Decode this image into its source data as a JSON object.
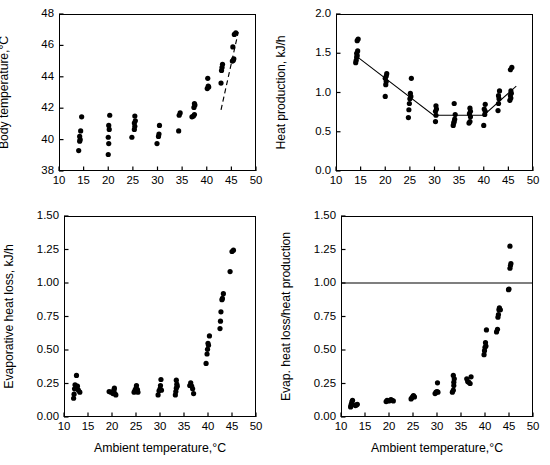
{
  "figure": {
    "shared_xlabel": "Ambient temperature,°C",
    "dot_color": "#000000",
    "line_color": "#000000",
    "background": "#ffffff"
  },
  "chart_data": [
    {
      "id": "body-temperature",
      "type": "scatter",
      "position": "top-left",
      "title": "",
      "xlabel": "",
      "ylabel": "Body temperature,°C",
      "xlim": [
        10,
        50
      ],
      "ylim": [
        38,
        48
      ],
      "xticks": [
        10,
        15,
        20,
        25,
        30,
        35,
        40,
        45,
        50
      ],
      "yticks": [
        38,
        40,
        42,
        44,
        46,
        48
      ],
      "grid": false,
      "legend": null,
      "points": [
        [
          14.0,
          39.3
        ],
        [
          14.2,
          39.9
        ],
        [
          14.3,
          40.0
        ],
        [
          14.2,
          40.2
        ],
        [
          14.4,
          40.55
        ],
        [
          14.6,
          41.45
        ],
        [
          20.0,
          39.05
        ],
        [
          20.1,
          39.75
        ],
        [
          20.0,
          40.15
        ],
        [
          20.2,
          40.65
        ],
        [
          20.1,
          40.9
        ],
        [
          20.3,
          41.55
        ],
        [
          24.8,
          40.15
        ],
        [
          25.3,
          40.65
        ],
        [
          25.4,
          40.85
        ],
        [
          25.3,
          41.05
        ],
        [
          25.5,
          41.2
        ],
        [
          25.4,
          41.5
        ],
        [
          29.9,
          39.75
        ],
        [
          30.2,
          40.2
        ],
        [
          30.3,
          40.35
        ],
        [
          30.4,
          40.9
        ],
        [
          34.3,
          40.55
        ],
        [
          34.4,
          41.55
        ],
        [
          34.6,
          41.7
        ],
        [
          37.0,
          41.45
        ],
        [
          37.3,
          41.5
        ],
        [
          37.5,
          41.6
        ],
        [
          37.4,
          42.05
        ],
        [
          37.6,
          42.2
        ],
        [
          37.5,
          42.3
        ],
        [
          40.1,
          43.25
        ],
        [
          40.3,
          43.4
        ],
        [
          40.4,
          43.35
        ],
        [
          40.2,
          43.9
        ],
        [
          42.9,
          43.6
        ],
        [
          43.0,
          44.4
        ],
        [
          43.1,
          44.6
        ],
        [
          43.2,
          44.8
        ],
        [
          45.2,
          45.0
        ],
        [
          45.4,
          45.05
        ],
        [
          45.5,
          45.15
        ],
        [
          45.3,
          45.9
        ],
        [
          45.6,
          46.7
        ],
        [
          45.9,
          46.8
        ]
      ],
      "annotations": [
        {
          "kind": "dashed-trend-line",
          "x1": 42.9,
          "y1": 41.9,
          "x2": 46.4,
          "y2": 46.85
        }
      ]
    },
    {
      "id": "heat-production",
      "type": "scatter",
      "position": "top-right",
      "title": "",
      "xlabel": "",
      "ylabel": "Heat production, kJ/h",
      "xlim": [
        10,
        50
      ],
      "ylim": [
        0.0,
        2.0
      ],
      "xticks": [
        10,
        15,
        20,
        25,
        30,
        35,
        40,
        45,
        50
      ],
      "yticks": [
        0.0,
        0.5,
        1.0,
        1.5,
        2.0
      ],
      "ytick_labels": [
        "0.0",
        "0.5",
        "1.0",
        "1.5",
        "2.0"
      ],
      "grid": false,
      "legend": null,
      "points": [
        [
          14.0,
          1.38
        ],
        [
          14.1,
          1.41
        ],
        [
          14.2,
          1.45
        ],
        [
          14.3,
          1.47
        ],
        [
          14.2,
          1.5
        ],
        [
          14.4,
          1.53
        ],
        [
          14.3,
          1.66
        ],
        [
          14.5,
          1.68
        ],
        [
          20.0,
          0.95
        ],
        [
          20.1,
          1.1
        ],
        [
          20.2,
          1.14
        ],
        [
          20.0,
          1.18
        ],
        [
          20.2,
          1.21
        ],
        [
          20.3,
          1.24
        ],
        [
          24.7,
          0.68
        ],
        [
          24.8,
          0.78
        ],
        [
          24.9,
          0.86
        ],
        [
          25.0,
          0.92
        ],
        [
          25.2,
          0.95
        ],
        [
          25.1,
          0.99
        ],
        [
          25.3,
          1.18
        ],
        [
          30.2,
          0.63
        ],
        [
          30.3,
          0.71
        ],
        [
          30.2,
          0.76
        ],
        [
          30.4,
          0.79
        ],
        [
          30.3,
          0.83
        ],
        [
          33.8,
          0.58
        ],
        [
          33.9,
          0.61
        ],
        [
          34.0,
          0.63
        ],
        [
          34.1,
          0.66
        ],
        [
          34.2,
          0.72
        ],
        [
          34.0,
          0.86
        ],
        [
          37.0,
          0.61
        ],
        [
          37.2,
          0.63
        ],
        [
          37.3,
          0.69
        ],
        [
          37.1,
          0.73
        ],
        [
          37.3,
          0.76
        ],
        [
          37.2,
          0.8
        ],
        [
          40.0,
          0.58
        ],
        [
          40.2,
          0.72
        ],
        [
          40.3,
          0.76
        ],
        [
          40.1,
          0.79
        ],
        [
          40.3,
          0.85
        ],
        [
          42.9,
          0.77
        ],
        [
          43.0,
          0.86
        ],
        [
          43.1,
          0.92
        ],
        [
          43.0,
          0.96
        ],
        [
          43.2,
          1.02
        ],
        [
          45.3,
          0.9
        ],
        [
          45.5,
          0.93
        ],
        [
          45.4,
          0.96
        ],
        [
          45.6,
          0.99
        ],
        [
          45.5,
          1.02
        ],
        [
          45.4,
          1.29
        ],
        [
          45.7,
          1.32
        ]
      ],
      "annotations": [
        {
          "kind": "fitted-broken-line",
          "vertices": [
            [
              14.0,
              1.47
            ],
            [
              29.8,
              0.71
            ],
            [
              40.0,
              0.71
            ],
            [
              46.6,
              1.08
            ]
          ]
        }
      ]
    },
    {
      "id": "evaporative-heat-loss",
      "type": "scatter",
      "position": "bottom-left",
      "title": "",
      "xlabel": "Ambient temperature,°C",
      "ylabel": "Evaporative heat loss, kJ/h",
      "xlim": [
        10,
        50
      ],
      "ylim": [
        0.0,
        1.5
      ],
      "xticks": [
        10,
        15,
        20,
        25,
        30,
        35,
        40,
        45,
        50
      ],
      "yticks": [
        0.0,
        0.25,
        0.5,
        0.75,
        1.0,
        1.25,
        1.5
      ],
      "ytick_labels": [
        "0.00",
        "0.25",
        "0.50",
        "0.75",
        "1.00",
        "1.25",
        "1.50"
      ],
      "grid": false,
      "legend": null,
      "points": [
        [
          12.0,
          0.14
        ],
        [
          12.1,
          0.17
        ],
        [
          12.2,
          0.21
        ],
        [
          12.3,
          0.24
        ],
        [
          12.6,
          0.31
        ],
        [
          12.8,
          0.23
        ],
        [
          13.0,
          0.2
        ],
        [
          13.3,
          0.185
        ],
        [
          19.4,
          0.19
        ],
        [
          19.8,
          0.185
        ],
        [
          20.2,
          0.175
        ],
        [
          20.4,
          0.2
        ],
        [
          20.5,
          0.215
        ],
        [
          20.6,
          0.175
        ],
        [
          20.8,
          0.165
        ],
        [
          24.6,
          0.185
        ],
        [
          24.8,
          0.2
        ],
        [
          25.0,
          0.215
        ],
        [
          25.1,
          0.235
        ],
        [
          25.3,
          0.205
        ],
        [
          25.4,
          0.185
        ],
        [
          29.6,
          0.165
        ],
        [
          29.8,
          0.195
        ],
        [
          30.0,
          0.21
        ],
        [
          30.1,
          0.235
        ],
        [
          30.2,
          0.28
        ],
        [
          30.3,
          0.2
        ],
        [
          33.2,
          0.165
        ],
        [
          33.3,
          0.19
        ],
        [
          33.4,
          0.215
        ],
        [
          33.5,
          0.245
        ],
        [
          33.4,
          0.275
        ],
        [
          33.6,
          0.23
        ],
        [
          36.2,
          0.235
        ],
        [
          36.4,
          0.255
        ],
        [
          36.6,
          0.23
        ],
        [
          36.8,
          0.21
        ],
        [
          37.0,
          0.175
        ],
        [
          39.6,
          0.4
        ],
        [
          39.8,
          0.47
        ],
        [
          39.9,
          0.505
        ],
        [
          40.0,
          0.55
        ],
        [
          40.1,
          0.535
        ],
        [
          40.3,
          0.605
        ],
        [
          42.5,
          0.66
        ],
        [
          42.6,
          0.715
        ],
        [
          42.7,
          0.785
        ],
        [
          42.9,
          0.875
        ],
        [
          43.0,
          0.885
        ],
        [
          43.2,
          0.92
        ],
        [
          44.6,
          1.085
        ],
        [
          45.0,
          1.235
        ],
        [
          45.3,
          1.245
        ]
      ],
      "annotations": []
    },
    {
      "id": "evap-heat-loss-over-heat-production",
      "type": "scatter",
      "position": "bottom-right",
      "title": "",
      "xlabel": "Ambient temperature,°C",
      "ylabel": "Evap. heat loss/heat production",
      "xlim": [
        10,
        50
      ],
      "ylim": [
        0.0,
        1.5
      ],
      "xticks": [
        10,
        15,
        20,
        25,
        30,
        35,
        40,
        45,
        50
      ],
      "yticks": [
        0.0,
        0.25,
        0.5,
        0.75,
        1.0,
        1.25,
        1.5
      ],
      "ytick_labels": [
        "0.00",
        "0.25",
        "0.50",
        "0.75",
        "1.00",
        "1.25",
        "1.50"
      ],
      "grid": false,
      "legend": null,
      "points": [
        [
          12.0,
          0.075
        ],
        [
          12.1,
          0.09
        ],
        [
          12.2,
          0.1
        ],
        [
          12.3,
          0.115
        ],
        [
          12.4,
          0.125
        ],
        [
          13.0,
          0.085
        ],
        [
          13.2,
          0.09
        ],
        [
          13.4,
          0.095
        ],
        [
          19.4,
          0.115
        ],
        [
          19.6,
          0.125
        ],
        [
          20.0,
          0.12
        ],
        [
          20.4,
          0.13
        ],
        [
          20.6,
          0.125
        ],
        [
          20.9,
          0.12
        ],
        [
          24.6,
          0.135
        ],
        [
          24.8,
          0.145
        ],
        [
          25.0,
          0.155
        ],
        [
          25.1,
          0.16
        ],
        [
          25.3,
          0.15
        ],
        [
          29.6,
          0.175
        ],
        [
          29.8,
          0.185
        ],
        [
          30.0,
          0.19
        ],
        [
          30.2,
          0.185
        ],
        [
          30.1,
          0.255
        ],
        [
          33.2,
          0.185
        ],
        [
          33.4,
          0.2
        ],
        [
          33.5,
          0.235
        ],
        [
          33.5,
          0.26
        ],
        [
          33.6,
          0.285
        ],
        [
          33.4,
          0.31
        ],
        [
          36.2,
          0.285
        ],
        [
          36.4,
          0.265
        ],
        [
          36.6,
          0.26
        ],
        [
          36.9,
          0.25
        ],
        [
          37.1,
          0.3
        ],
        [
          39.8,
          0.465
        ],
        [
          39.9,
          0.495
        ],
        [
          40.0,
          0.52
        ],
        [
          40.2,
          0.53
        ],
        [
          40.1,
          0.555
        ],
        [
          40.3,
          0.65
        ],
        [
          42.4,
          0.635
        ],
        [
          42.6,
          0.655
        ],
        [
          42.7,
          0.745
        ],
        [
          42.8,
          0.765
        ],
        [
          42.9,
          0.8
        ],
        [
          43.0,
          0.815
        ],
        [
          43.2,
          0.8
        ],
        [
          44.9,
          0.95
        ],
        [
          45.0,
          0.955
        ],
        [
          45.2,
          1.11
        ],
        [
          45.3,
          1.13
        ],
        [
          45.4,
          1.145
        ],
        [
          45.2,
          1.275
        ]
      ],
      "annotations": [
        {
          "kind": "horizontal-reference-line",
          "y": 1.0
        }
      ]
    }
  ]
}
